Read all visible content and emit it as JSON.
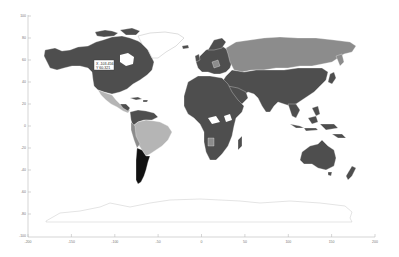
{
  "figure": {
    "type": "world-map",
    "background": "#ffffff"
  },
  "axes": {
    "x": {
      "ticks": [
        "-200",
        "-150",
        "-100",
        "-50",
        "0",
        "50",
        "100",
        "150",
        "200"
      ],
      "range": [
        -200,
        200
      ]
    },
    "y": {
      "ticks": [
        "100",
        "80",
        "60",
        "40",
        "20",
        "0",
        "-20",
        "-40",
        "-60",
        "-80",
        "-100"
      ],
      "range": [
        -100,
        100
      ]
    },
    "color": "#bbbbbb"
  },
  "datatip": {
    "x_line": "X -103.456",
    "y_line": "Y 60.321"
  },
  "legend_colors": {
    "dark": "#4e4e4e",
    "medium": "#8c8c8c",
    "light": "#b5b5b5",
    "black": "#111111",
    "outline": "#c8c8c8"
  },
  "regions": [
    {
      "name": "North America",
      "shade": "dark"
    },
    {
      "name": "Greenland",
      "shade": "none"
    },
    {
      "name": "Mexico & Central America",
      "shade": "light"
    },
    {
      "name": "South America (Brazil etc.)",
      "shade": "light"
    },
    {
      "name": "Argentina",
      "shade": "black"
    },
    {
      "name": "Europe",
      "shade": "dark"
    },
    {
      "name": "Russia",
      "shade": "medium"
    },
    {
      "name": "Asia",
      "shade": "dark"
    },
    {
      "name": "Africa",
      "shade": "dark"
    },
    {
      "name": "Australia",
      "shade": "dark"
    },
    {
      "name": "Antarctica",
      "shade": "none"
    }
  ]
}
